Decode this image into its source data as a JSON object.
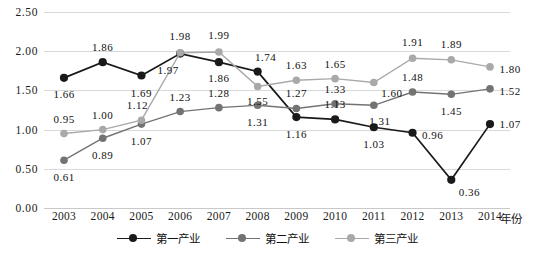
{
  "chart_data": {
    "type": "line",
    "title": "",
    "xlabel": "年份",
    "ylabel": "",
    "ylim": [
      0.0,
      2.5
    ],
    "yticks": [
      "0.00",
      "0.50",
      "1.00",
      "1.50",
      "2.00",
      "2.50"
    ],
    "ytick_values": [
      0.0,
      0.5,
      1.0,
      1.5,
      2.0,
      2.5
    ],
    "grid": true,
    "legend_position": "bottom",
    "categories": [
      "2003",
      "2004",
      "2005",
      "2006",
      "2007",
      "2008",
      "2009",
      "2010",
      "2011",
      "2012",
      "2013",
      "2014"
    ],
    "series": [
      {
        "name": "第一产业",
        "color": "#1a1a1a",
        "values": [
          1.66,
          1.86,
          1.69,
          1.97,
          1.86,
          1.74,
          1.16,
          1.13,
          1.03,
          0.96,
          0.36,
          1.07
        ],
        "labels": [
          "1.66",
          "1.86",
          "1.69",
          "1.97",
          "1.86",
          "1.74",
          "1.16",
          "1.13",
          "1.03",
          "0.96",
          "0.36",
          "1.07"
        ]
      },
      {
        "name": "第二产业",
        "color": "#737373",
        "values": [
          0.61,
          0.89,
          1.07,
          1.23,
          1.28,
          1.31,
          1.27,
          1.33,
          1.31,
          1.48,
          1.45,
          1.52
        ],
        "labels": [
          "0.61",
          "0.89",
          "1.07",
          "1.23",
          "1.28",
          "1.31",
          "1.27",
          "1.33",
          "1.31",
          "1.48",
          "1.45",
          "1.52"
        ]
      },
      {
        "name": "第三产业",
        "color": "#a9a9a9",
        "values": [
          0.95,
          1.0,
          1.12,
          1.98,
          1.99,
          1.55,
          1.63,
          1.65,
          1.6,
          1.91,
          1.89,
          1.8
        ],
        "labels": [
          "0.95",
          "1.00",
          "1.12",
          "1.98",
          "1.99",
          "1.55",
          "1.63",
          "1.65",
          "1.60",
          "1.91",
          "1.89",
          "1.80"
        ]
      }
    ],
    "label_offsets": [
      [
        [
          0,
          16
        ],
        [
          0,
          -15
        ],
        [
          0,
          17
        ],
        [
          -12,
          16
        ],
        [
          0,
          16
        ],
        [
          8,
          -15
        ],
        [
          0,
          17
        ],
        [
          0,
          -15
        ],
        [
          0,
          17
        ],
        [
          20,
          2
        ],
        [
          18,
          12
        ],
        [
          20,
          0
        ]
      ],
      [
        [
          0,
          17
        ],
        [
          0,
          17
        ],
        [
          0,
          17
        ],
        [
          0,
          -15
        ],
        [
          0,
          -15
        ],
        [
          0,
          17
        ],
        [
          0,
          -15
        ],
        [
          0,
          -15
        ],
        [
          6,
          16
        ],
        [
          0,
          -15
        ],
        [
          0,
          17
        ],
        [
          20,
          2
        ]
      ],
      [
        [
          0,
          -15
        ],
        [
          0,
          -15
        ],
        [
          -4,
          -15
        ],
        [
          0,
          -17
        ],
        [
          0,
          -17
        ],
        [
          0,
          15
        ],
        [
          0,
          -15
        ],
        [
          0,
          -15
        ],
        [
          18,
          10
        ],
        [
          0,
          -16
        ],
        [
          0,
          -16
        ],
        [
          20,
          2
        ]
      ]
    ]
  },
  "caption": ""
}
